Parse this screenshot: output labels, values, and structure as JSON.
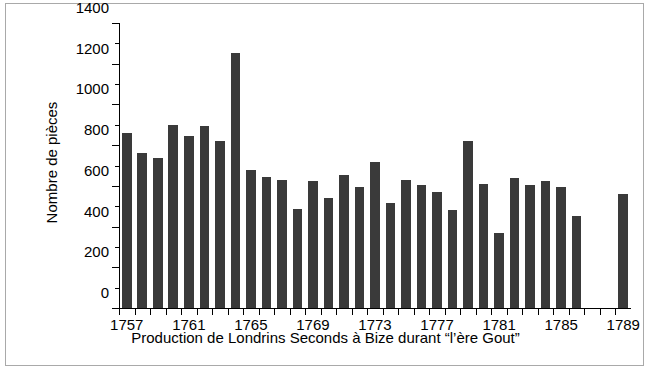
{
  "chart_data": {
    "type": "bar",
    "title": "",
    "xlabel": "Production de Londrins Seconds à Bize durant “l’ère Gout”",
    "ylabel": "Nombre de pièces",
    "ylim": [
      0,
      1400
    ],
    "ytick_step": 200,
    "yminor_step": 100,
    "grid": false,
    "legend": null,
    "bar_color": "#3a3a3a",
    "axis_color": "#000000",
    "background": "#ffffff",
    "frame_color": "#a9a9a9",
    "xlim": [
      1756.5,
      1789.5
    ],
    "xtick_labels": [
      "1757",
      "1761",
      "1765",
      "1769",
      "1773",
      "1777",
      "1781",
      "1785",
      "1789"
    ],
    "ytick_labels": [
      "0",
      "200",
      "400",
      "600",
      "800",
      "1000",
      "1200",
      "1400"
    ],
    "categories": [
      1757,
      1758,
      1759,
      1760,
      1761,
      1762,
      1763,
      1764,
      1765,
      1766,
      1767,
      1768,
      1769,
      1770,
      1771,
      1772,
      1773,
      1774,
      1775,
      1776,
      1777,
      1778,
      1779,
      1780,
      1781,
      1782,
      1783,
      1784,
      1785,
      1786,
      1787,
      1788,
      1789
    ],
    "values": [
      860,
      760,
      735,
      900,
      845,
      895,
      820,
      1255,
      680,
      645,
      630,
      485,
      625,
      540,
      655,
      595,
      715,
      515,
      630,
      605,
      570,
      480,
      820,
      610,
      370,
      640,
      605,
      625,
      595,
      450,
      null,
      null,
      560
    ]
  }
}
